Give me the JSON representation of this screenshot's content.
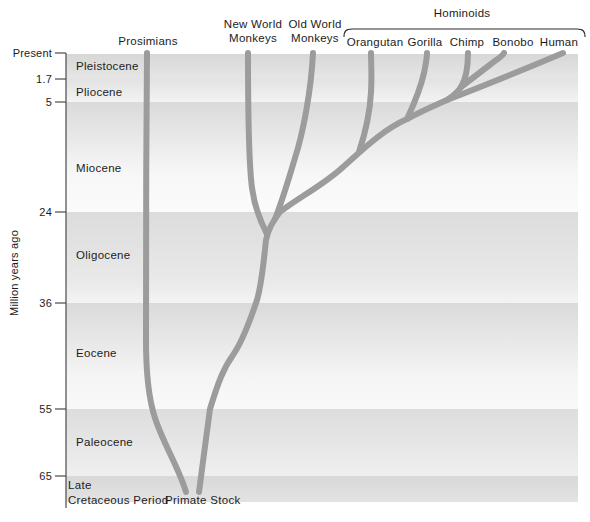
{
  "colors": {
    "branch": "#9c9c9c",
    "text": "#1c1c1c",
    "axis": "#4a4a4a"
  },
  "y_axis": {
    "title": "Million years ago",
    "ticks": [
      "Present",
      "1.7",
      "5",
      "24",
      "36",
      "55",
      "65"
    ]
  },
  "epochs": [
    "Pleistocene",
    "Pliocene",
    "Miocene",
    "Oligocene",
    "Eocene",
    "Paleocene"
  ],
  "late_cretaceous": [
    "Late",
    "Cretaceous Period"
  ],
  "root_label": "Primate Stock",
  "clade_label": "Hominoids",
  "tips": {
    "prosimians": "Prosimians",
    "new_world": [
      "New World",
      "Monkeys"
    ],
    "old_world": [
      "Old World",
      "Monkeys"
    ],
    "orangutan": "Orangutan",
    "gorilla": "Gorilla",
    "chimp": "Chimp",
    "bonobo": "Bonobo",
    "human": "Human"
  },
  "tree": {
    "type": "phylogeny",
    "root": "Primate Stock",
    "time_axis_unit": "Million years ago",
    "tip_order": [
      "Prosimians",
      "New World Monkeys",
      "Old World Monkeys",
      "Orangutan",
      "Gorilla",
      "Chimp",
      "Bonobo",
      "Human"
    ],
    "hominoid_members": [
      "Orangutan",
      "Gorilla",
      "Chimp",
      "Bonobo",
      "Human"
    ]
  }
}
